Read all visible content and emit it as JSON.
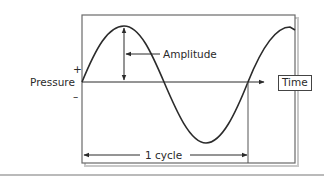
{
  "diagram": {
    "labels": {
      "plus": "+",
      "minus": "–",
      "y_axis": "Pressure",
      "x_axis": "Time",
      "amplitude": "Amplitude",
      "cycle": "1 cycle"
    },
    "colors": {
      "line": "#2b2b2b",
      "frame": "#666666",
      "shadow": "#bdbdbd",
      "background": "#ffffff"
    }
  }
}
